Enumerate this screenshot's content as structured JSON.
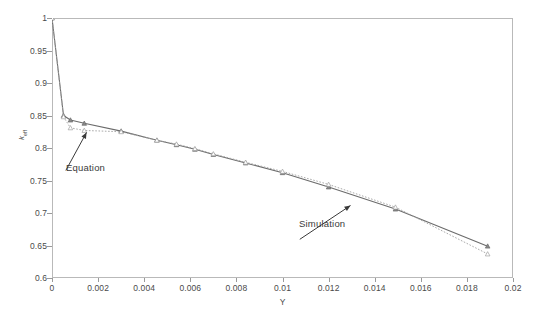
{
  "chart_data": {
    "type": "line",
    "title": "",
    "subtitle": "",
    "xlabel": "Y",
    "ylabel": "k",
    "ylabel_sub": "eff",
    "xlim": [
      0,
      0.02
    ],
    "ylim": [
      0.6,
      1
    ],
    "xticks": [
      0,
      0.002,
      0.004,
      0.006,
      0.008,
      0.01,
      0.012,
      0.014,
      0.016,
      0.018,
      0.02
    ],
    "xtick_labels": [
      "0",
      "0.002",
      "0.004",
      "0.006",
      "0.008",
      "0.01",
      "0.012",
      "0.014",
      "0.016",
      "0.018",
      "0.02"
    ],
    "yticks": [
      0.6,
      0.65,
      0.7,
      0.75,
      0.8,
      0.85,
      0.9,
      0.95,
      1
    ],
    "ytick_labels": [
      "0.6",
      "0.65",
      "0.7",
      "0.75",
      "0.8",
      "0.85",
      "0.9",
      "0.95",
      "1"
    ],
    "grid": false,
    "legend_position": "none",
    "series": [
      {
        "name": "Simulation",
        "style": "solid",
        "color": "#6b6b6b",
        "marker": "triangle",
        "x": [
          0.0,
          0.0005,
          0.0008,
          0.0014,
          0.003,
          0.00455,
          0.0054,
          0.0062,
          0.007,
          0.0084,
          0.01,
          0.012,
          0.0149,
          0.0189
        ],
        "y": [
          1.0,
          0.85,
          0.843,
          0.838,
          0.826,
          0.812,
          0.805,
          0.798,
          0.79,
          0.777,
          0.762,
          0.74,
          0.706,
          0.649
        ]
      },
      {
        "name": "Equation",
        "style": "dotted",
        "color": "#a0a0a0",
        "marker": "triangle",
        "x": [
          0.0,
          0.0005,
          0.0008,
          0.0014,
          0.003,
          0.00455,
          0.0054,
          0.0062,
          0.007,
          0.0084,
          0.01,
          0.012,
          0.0149,
          0.0189
        ],
        "y": [
          1.0,
          0.848,
          0.831,
          0.827,
          0.825,
          0.812,
          0.806,
          0.799,
          0.791,
          0.778,
          0.764,
          0.744,
          0.709,
          0.637
        ]
      }
    ],
    "annotations": [
      {
        "label": "Equation",
        "text_x": 0.0006,
        "text_y": 0.7655,
        "point_x": 0.0015,
        "point_y": 0.824
      },
      {
        "label": "Simulation",
        "text_x": 0.01075,
        "text_y": 0.6595,
        "point_x": 0.01295,
        "point_y": 0.7115
      }
    ]
  },
  "axes": {
    "frame_color": "#b9b9b9",
    "tick_color": "#9a9a9a",
    "label_color": "#4a4a4a"
  }
}
